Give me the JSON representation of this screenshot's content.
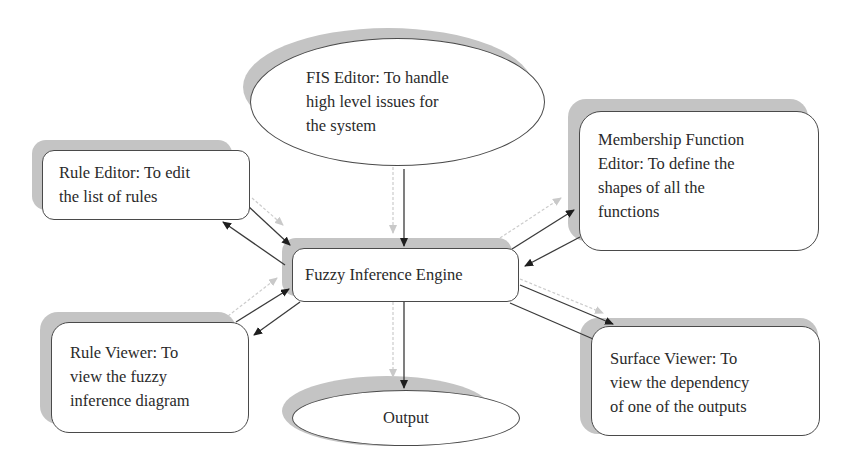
{
  "diagram": {
    "center": {
      "label": "Fuzzy Inference Engine"
    },
    "fis_editor": {
      "lines": [
        "FIS Editor: To handle",
        "high level issues for",
        "the system"
      ]
    },
    "rule_editor": {
      "lines": [
        "Rule Editor: To edit",
        "the list of rules"
      ]
    },
    "membership_editor": {
      "lines": [
        "Membership Function",
        "Editor: To define the",
        "shapes of all the",
        "functions"
      ]
    },
    "rule_viewer": {
      "lines": [
        "Rule Viewer: To",
        "view the fuzzy",
        "inference diagram"
      ]
    },
    "surface_viewer": {
      "lines": [
        "Surface Viewer: To",
        "view the dependency",
        "of one of the outputs"
      ]
    },
    "output": {
      "label": "Output"
    },
    "edges": [
      {
        "from": "FIS Editor",
        "to": "Fuzzy Inference Engine",
        "direction": "one-way"
      },
      {
        "from": "Rule Editor",
        "to": "Fuzzy Inference Engine",
        "direction": "two-way"
      },
      {
        "from": "Membership Function Editor",
        "to": "Fuzzy Inference Engine",
        "direction": "two-way"
      },
      {
        "from": "Rule Viewer",
        "to": "Fuzzy Inference Engine",
        "direction": "two-way"
      },
      {
        "from": "Fuzzy Inference Engine",
        "to": "Surface Viewer",
        "direction": "one-way"
      },
      {
        "from": "Fuzzy Inference Engine",
        "to": "Output",
        "direction": "one-way"
      }
    ],
    "colors": {
      "stroke": "#4a4a4a",
      "shadow": "#c4c4c4",
      "ghost_arrow": "#cfcfcf"
    }
  }
}
